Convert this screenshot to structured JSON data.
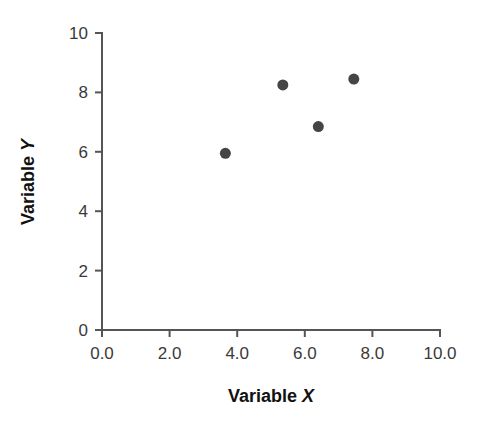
{
  "chart_data": {
    "type": "scatter",
    "title": "",
    "xlabel": "Variable X",
    "ylabel": "Variable Y",
    "xlim": [
      0,
      10
    ],
    "ylim": [
      0,
      10
    ],
    "grid": false,
    "legend": false,
    "x_ticks": [
      0,
      2,
      4,
      6,
      8,
      10
    ],
    "y_ticks": [
      0,
      2,
      4,
      6,
      8,
      10
    ],
    "x_tick_labels": [
      "0.0",
      "2.0",
      "4.0",
      "6.0",
      "8.0",
      "10.0"
    ],
    "y_tick_labels": [
      "0",
      "2",
      "4",
      "6",
      "8",
      "10"
    ],
    "series": [
      {
        "name": "observations",
        "marker": "filled-circle",
        "color": "#454545",
        "marker_size": 11,
        "points": [
          {
            "x": 3.65,
            "y": 5.95
          },
          {
            "x": 5.35,
            "y": 8.25
          },
          {
            "x": 6.4,
            "y": 6.85
          },
          {
            "x": 7.45,
            "y": 8.45
          }
        ]
      }
    ]
  },
  "axes": {
    "x_title_prefix": "Variable ",
    "x_title_variable": "X",
    "y_title_prefix": "Variable ",
    "y_title_variable": "Y"
  },
  "colors": {
    "marker": "#454545",
    "axis": "#555555",
    "tick_text": "#3a3a3a",
    "title_text": "#111111",
    "background": "#ffffff"
  }
}
